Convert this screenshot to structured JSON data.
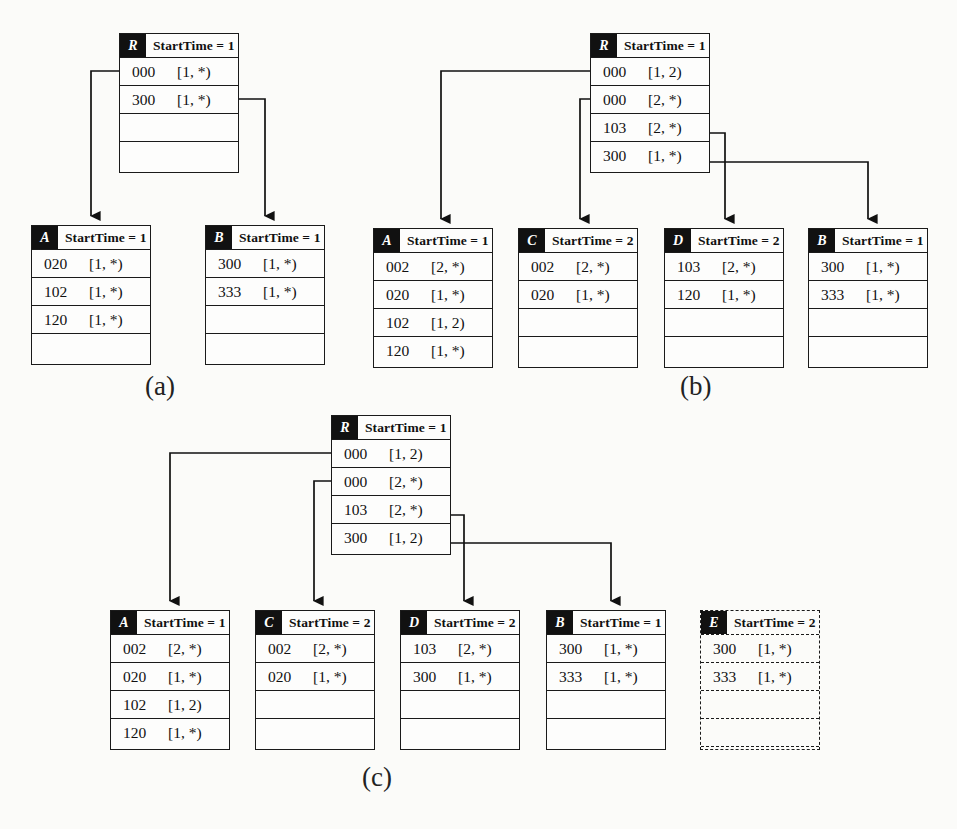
{
  "figure": {
    "background": "#fbfbf9",
    "ink": "#111111",
    "captions": [
      {
        "id": "cap-a",
        "text": "(a)",
        "x": 145,
        "y": 371
      },
      {
        "id": "cap-b",
        "text": "(b)",
        "x": 680,
        "y": 371
      },
      {
        "id": "cap-c",
        "text": "(c)",
        "x": 362,
        "y": 762
      }
    ]
  },
  "panels": [
    {
      "id": "a",
      "caption": "(a)",
      "nodes": [
        {
          "id": "a-root",
          "tag": "R",
          "starttime_label": "StartTime = 1",
          "dashed": false,
          "x": 119,
          "y": 33,
          "w": 120,
          "h": 140,
          "rows": [
            {
              "key": "000",
              "interval": "[1, *)"
            },
            {
              "key": "300",
              "interval": "[1, *)"
            },
            {
              "key": "",
              "interval": ""
            },
            {
              "key": "",
              "interval": ""
            }
          ]
        },
        {
          "id": "a-A",
          "tag": "A",
          "starttime_label": "StartTime = 1",
          "dashed": false,
          "x": 31,
          "y": 225,
          "w": 120,
          "h": 140,
          "rows": [
            {
              "key": "020",
              "interval": "[1, *)"
            },
            {
              "key": "102",
              "interval": "[1, *)"
            },
            {
              "key": "120",
              "interval": "[1, *)"
            },
            {
              "key": "",
              "interval": ""
            }
          ]
        },
        {
          "id": "a-B",
          "tag": "B",
          "starttime_label": "StartTime = 1",
          "dashed": false,
          "x": 205,
          "y": 225,
          "w": 120,
          "h": 140,
          "rows": [
            {
              "key": "300",
              "interval": "[1, *)"
            },
            {
              "key": "333",
              "interval": "[1, *)"
            },
            {
              "key": "",
              "interval": ""
            },
            {
              "key": "",
              "interval": ""
            }
          ]
        }
      ],
      "edges": [
        {
          "id": "a-edge-000-A",
          "from_row": 0,
          "to": "a-A",
          "points": "119,71 91,71 91,216"
        },
        {
          "id": "a-edge-300-B",
          "from_row": 1,
          "to": "a-B",
          "points": "239,99 265,99 265,216"
        }
      ]
    },
    {
      "id": "b",
      "caption": "(b)",
      "nodes": [
        {
          "id": "b-root",
          "tag": "R",
          "starttime_label": "StartTime = 1",
          "dashed": false,
          "x": 590,
          "y": 33,
          "w": 120,
          "h": 140,
          "rows": [
            {
              "key": "000",
              "interval": "[1, 2)"
            },
            {
              "key": "000",
              "interval": "[2, *)"
            },
            {
              "key": "103",
              "interval": "[2, *)"
            },
            {
              "key": "300",
              "interval": "[1, *)"
            }
          ]
        },
        {
          "id": "b-A",
          "tag": "A",
          "starttime_label": "StartTime = 1",
          "dashed": false,
          "x": 373,
          "y": 228,
          "w": 120,
          "h": 140,
          "rows": [
            {
              "key": "002",
              "interval": "[2, *)"
            },
            {
              "key": "020",
              "interval": "[1, *)"
            },
            {
              "key": "102",
              "interval": "[1, 2)"
            },
            {
              "key": "120",
              "interval": "[1, *)"
            }
          ]
        },
        {
          "id": "b-C",
          "tag": "C",
          "starttime_label": "StartTime = 2",
          "dashed": false,
          "x": 518,
          "y": 228,
          "w": 120,
          "h": 140,
          "rows": [
            {
              "key": "002",
              "interval": "[2, *)"
            },
            {
              "key": "020",
              "interval": "[1, *)"
            },
            {
              "key": "",
              "interval": ""
            },
            {
              "key": "",
              "interval": ""
            }
          ]
        },
        {
          "id": "b-D",
          "tag": "D",
          "starttime_label": "StartTime = 2",
          "dashed": false,
          "x": 664,
          "y": 228,
          "w": 120,
          "h": 140,
          "rows": [
            {
              "key": "103",
              "interval": "[2, *)"
            },
            {
              "key": "120",
              "interval": "[1, *)"
            },
            {
              "key": "",
              "interval": ""
            },
            {
              "key": "",
              "interval": ""
            }
          ]
        },
        {
          "id": "b-B",
          "tag": "B",
          "starttime_label": "StartTime = 1",
          "dashed": false,
          "x": 808,
          "y": 228,
          "w": 120,
          "h": 140,
          "rows": [
            {
              "key": "300",
              "interval": "[1, *)"
            },
            {
              "key": "333",
              "interval": "[1, *)"
            },
            {
              "key": "",
              "interval": ""
            },
            {
              "key": "",
              "interval": ""
            }
          ]
        }
      ],
      "edges": [
        {
          "id": "b-edge-0-A",
          "from_row": 0,
          "to": "b-A",
          "points": "590,71 441,71 441,219"
        },
        {
          "id": "b-edge-1-C",
          "from_row": 1,
          "to": "b-C",
          "points": "590,99 580,99 580,219"
        },
        {
          "id": "b-edge-2-D",
          "from_row": 2,
          "to": "b-D",
          "points": "710,133 725,133 725,219"
        },
        {
          "id": "b-edge-3-B",
          "from_row": 3,
          "to": "b-B",
          "points": "710,162 868,162 868,219"
        }
      ]
    },
    {
      "id": "c",
      "caption": "(c)",
      "nodes": [
        {
          "id": "c-root",
          "tag": "R",
          "starttime_label": "StartTime = 1",
          "dashed": false,
          "x": 331,
          "y": 415,
          "w": 120,
          "h": 140,
          "rows": [
            {
              "key": "000",
              "interval": "[1, 2)"
            },
            {
              "key": "000",
              "interval": "[2, *)"
            },
            {
              "key": "103",
              "interval": "[2, *)"
            },
            {
              "key": "300",
              "interval": "[1, 2)"
            }
          ]
        },
        {
          "id": "c-A",
          "tag": "A",
          "starttime_label": "StartTime = 1",
          "dashed": false,
          "x": 110,
          "y": 610,
          "w": 120,
          "h": 140,
          "rows": [
            {
              "key": "002",
              "interval": "[2, *)"
            },
            {
              "key": "020",
              "interval": "[1, *)"
            },
            {
              "key": "102",
              "interval": "[1, 2)"
            },
            {
              "key": "120",
              "interval": "[1, *)"
            }
          ]
        },
        {
          "id": "c-C",
          "tag": "C",
          "starttime_label": "StartTime = 2",
          "dashed": false,
          "x": 255,
          "y": 610,
          "w": 120,
          "h": 140,
          "rows": [
            {
              "key": "002",
              "interval": "[2, *)"
            },
            {
              "key": "020",
              "interval": "[1, *)"
            },
            {
              "key": "",
              "interval": ""
            },
            {
              "key": "",
              "interval": ""
            }
          ]
        },
        {
          "id": "c-D",
          "tag": "D",
          "starttime_label": "StartTime = 2",
          "dashed": false,
          "x": 400,
          "y": 610,
          "w": 120,
          "h": 140,
          "rows": [
            {
              "key": "103",
              "interval": "[2, *)"
            },
            {
              "key": "300",
              "interval": "[1, *)"
            },
            {
              "key": "",
              "interval": ""
            },
            {
              "key": "",
              "interval": ""
            }
          ]
        },
        {
          "id": "c-B",
          "tag": "B",
          "starttime_label": "StartTime = 1",
          "dashed": false,
          "x": 546,
          "y": 610,
          "w": 120,
          "h": 140,
          "rows": [
            {
              "key": "300",
              "interval": "[1, *)"
            },
            {
              "key": "333",
              "interval": "[1, *)"
            },
            {
              "key": "",
              "interval": ""
            },
            {
              "key": "",
              "interval": ""
            }
          ]
        },
        {
          "id": "c-E",
          "tag": "E",
          "starttime_label": "StartTime = 2",
          "dashed": true,
          "x": 700,
          "y": 610,
          "w": 120,
          "h": 140,
          "rows": [
            {
              "key": "300",
              "interval": "[1, *)"
            },
            {
              "key": "333",
              "interval": "[1, *)"
            },
            {
              "key": "",
              "interval": ""
            },
            {
              "key": "",
              "interval": ""
            }
          ]
        }
      ],
      "edges": [
        {
          "id": "c-edge-0-A",
          "from_row": 0,
          "to": "c-A",
          "points": "331,453 170,453 170,601"
        },
        {
          "id": "c-edge-1-C",
          "from_row": 1,
          "to": "c-C",
          "points": "331,481 314,481 314,601"
        },
        {
          "id": "c-edge-2-D",
          "from_row": 2,
          "to": "c-D",
          "points": "451,515 464,515 464,601"
        },
        {
          "id": "c-edge-3-B",
          "from_row": 3,
          "to": "c-B",
          "points": "451,543 611,543 611,601"
        }
      ]
    }
  ]
}
